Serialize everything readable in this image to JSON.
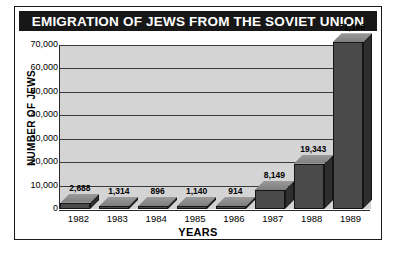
{
  "chart_data": {
    "type": "bar",
    "title": "EMIGRATION OF JEWS FROM THE SOVIET UNION",
    "xlabel": "YEARS",
    "ylabel": "NUMBER OF JEWS",
    "categories": [
      "1982",
      "1983",
      "1984",
      "1985",
      "1986",
      "1987",
      "1988",
      "1989"
    ],
    "values": [
      2688,
      1314,
      896,
      1140,
      914,
      8149,
      19343,
      71196
    ],
    "value_labels": [
      "2,688",
      "1,314",
      "896",
      "1,140",
      "914",
      "8,149",
      "19,343",
      "71,196"
    ],
    "ytick_labels": [
      "70,000",
      "60,000",
      "50,000",
      "40,000",
      "30,000",
      "20,000",
      "10,000",
      "0"
    ],
    "ytick_values": [
      70000,
      60000,
      50000,
      40000,
      30000,
      20000,
      10000,
      0
    ],
    "ylim": [
      0,
      70000
    ],
    "grid": true,
    "legend": false,
    "style": "3d-bar",
    "colors": {
      "title_bar": "#171717",
      "title_text": "#ffffff",
      "plot_background": "#d4d4d4",
      "bar_front": "#4a4a4a",
      "bar_top": "#8e8e8e",
      "bar_side": "#2e2e2e",
      "gridline": "#3a3a3a",
      "frame": "#1a1a1a",
      "page_background": "#ffffff"
    }
  }
}
